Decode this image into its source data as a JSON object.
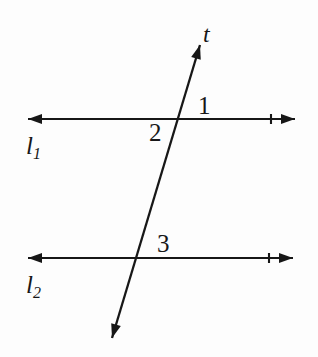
{
  "figure": {
    "type": "geometry-diagram",
    "background_color": "#fdfdfd",
    "stroke_color": "#171717"
  },
  "labels": {
    "transversal": "t",
    "line_1_name": "l",
    "line_1_subscript": "1",
    "line_2_name": "l",
    "line_2_subscript": "2",
    "angle_1": "1",
    "angle_2": "2",
    "angle_3": "3"
  },
  "geometry": {
    "line_1": {
      "name": "l1",
      "x1": 28,
      "y1": 119,
      "x2": 295,
      "y2": 119,
      "arrow_start": true,
      "arrow_end": true,
      "tick_x": 271
    },
    "line_2": {
      "name": "l2",
      "x1": 28,
      "y1": 258,
      "x2": 293,
      "y2": 258,
      "arrow_start": true,
      "arrow_end": true,
      "tick_x": 269
    },
    "transversal": {
      "name": "t",
      "x1": 112,
      "y1": 338,
      "x2": 200,
      "y2": 45,
      "arrow_start": true,
      "arrow_end": true
    },
    "intersections": [
      {
        "with": "l1",
        "x": 182,
        "y": 119
      },
      {
        "with": "l2",
        "x": 138,
        "y": 258
      }
    ],
    "stroke_width": 2.1,
    "arrow_length": 14,
    "arrow_half_width": 5
  }
}
